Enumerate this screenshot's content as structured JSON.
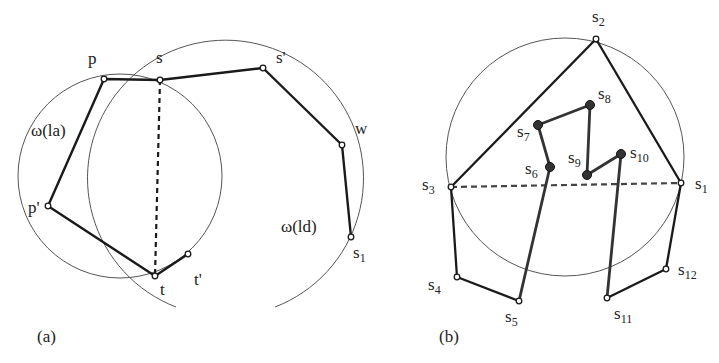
{
  "panel_a": {
    "caption": "(a)",
    "labels": {
      "p": "p",
      "s": "s",
      "s_prime": "s'",
      "w": "w",
      "s1": "s",
      "s1_sub": "1",
      "p_prime": "p'",
      "t": "t",
      "t_prime": "t'",
      "omega_la": "ω(la)",
      "omega_ld": "ω(ld)"
    }
  },
  "panel_b": {
    "caption": "(b)",
    "labels": {
      "s": "s",
      "sub1": "1",
      "sub2": "2",
      "sub3": "3",
      "sub4": "4",
      "sub5": "5",
      "sub6": "6",
      "sub7": "7",
      "sub8": "8",
      "sub9": "9",
      "sub10": "10",
      "sub11": "11",
      "sub12": "12"
    }
  },
  "colors": {
    "stroke": "#1a1a1a",
    "circle": "#555555",
    "inner_chain": "#333333",
    "background": "#ffffff"
  }
}
